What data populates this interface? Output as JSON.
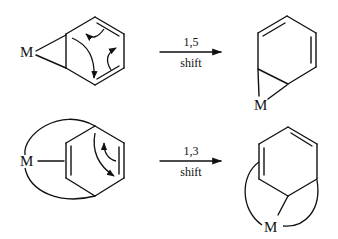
{
  "diagram": {
    "type": "reaction-scheme",
    "reactions": [
      {
        "reactant": {
          "metal_label": "M",
          "description": "metal-bridged bicyclic (cyclopropane-fused) cyclohexadiene with curved electron-shift arrows"
        },
        "arrow": {
          "label_top": "1,5",
          "label_bottom": "shift"
        },
        "product": {
          "metal_label": "M",
          "description": "rearranged metallacyclopropane-fused cyclohexadiene"
        }
      },
      {
        "reactant": {
          "metal_label": "M",
          "description": "metal-tethered bicyclic cyclohexadiene with ring strap and curved shift arrows"
        },
        "arrow": {
          "label_top": "1,3",
          "label_bottom": "shift"
        },
        "product": {
          "metal_label": "M",
          "description": "metal-strapped cyclohexadiene after 1,3 shift"
        }
      }
    ]
  }
}
